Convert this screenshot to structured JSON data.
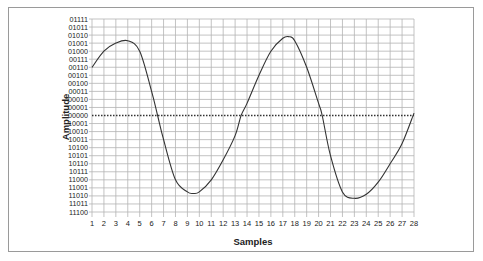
{
  "chart_data": {
    "type": "line",
    "title": "",
    "xlabel": "Samples",
    "ylabel": "Amplitude",
    "x_ticks": [
      "1",
      "2",
      "3",
      "4",
      "5",
      "6",
      "7",
      "8",
      "9",
      "10",
      "11",
      "12",
      "13",
      "14",
      "15",
      "16",
      "17",
      "18",
      "19",
      "20",
      "21",
      "22",
      "23",
      "24",
      "25",
      "26",
      "27",
      "28"
    ],
    "y_ticks": [
      "01111",
      "01011",
      "01010",
      "01001",
      "01000",
      "00111",
      "00110",
      "00101",
      "00100",
      "00011",
      "00010",
      "00001",
      "00000",
      "10001",
      "10010",
      "10011",
      "10100",
      "10101",
      "10110",
      "10111",
      "11000",
      "11001",
      "11010",
      "11011",
      "11100"
    ],
    "zero_line": {
      "label": "00000",
      "style": "dotted"
    },
    "grid": true,
    "legend": null,
    "series": [
      {
        "name": "waveform",
        "x": [
          1,
          2,
          3,
          4,
          5,
          6,
          6.5,
          7,
          8,
          9,
          9.5,
          10,
          11,
          12,
          13,
          13.5,
          14,
          15,
          16,
          17,
          17.5,
          18,
          19,
          20,
          20.3,
          21,
          22,
          23,
          24,
          25,
          26,
          27,
          28
        ],
        "values": [
          6,
          8,
          9,
          9.3,
          8,
          3,
          0,
          -3,
          -8,
          -9.5,
          -9.7,
          -9.5,
          -8,
          -5.5,
          -2.5,
          0,
          1.5,
          5,
          8,
          9.6,
          9.8,
          9.3,
          6,
          1.5,
          0,
          -5,
          -9.5,
          -10.3,
          -9.8,
          -8.3,
          -6,
          -3.5,
          0.3
        ]
      }
    ],
    "value_scale_note": "values in grid-row units relative to 00000 line (positive = upward)"
  }
}
